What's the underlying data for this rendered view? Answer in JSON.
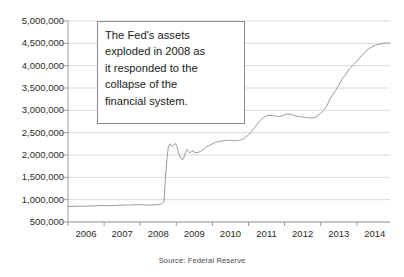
{
  "chart_data": {
    "type": "line",
    "title": "",
    "subtitle": "",
    "xlabel": "",
    "ylabel": "",
    "source_note": "Source: Federal Reserve",
    "grid": true,
    "legend": false,
    "legend_position": "none",
    "line_color": "#9a9a9a",
    "grid_color": "#d9d9d9",
    "axis_color": "#9a9a9a",
    "background_color": "#ffffff",
    "xlim": [
      2006.0,
      2014.92
    ],
    "ylim": [
      500000,
      5000000
    ],
    "y_tick_labels": [
      "5,000,000",
      "4,500,000",
      "4,000,000",
      "3,500,000",
      "3,000,000",
      "2,500,000",
      "2,000,000",
      "1,500,000",
      "1,000,000",
      "500,000"
    ],
    "y_tick_values": [
      5000000,
      4500000,
      4000000,
      3500000,
      3000000,
      2500000,
      2000000,
      1500000,
      1000000,
      500000
    ],
    "x_tick_labels": [
      "2006",
      "2007",
      "2008",
      "2009",
      "2010",
      "2011",
      "2012",
      "2013",
      "2014"
    ],
    "x_tick_values": [
      2006,
      2007,
      2008,
      2009,
      2010,
      2011,
      2012,
      2013,
      2014
    ],
    "annotations": [
      {
        "name": "fed-assets-callout",
        "text": "The Fed's assets exploded in 2008 as it responded to the collapse of the financial system.",
        "line1": "The Fed's assets",
        "line2": "exploded in 2008 as",
        "line3": "it responded to the",
        "line4": "collapse of the",
        "line5": "financial system."
      }
    ],
    "series": [
      {
        "name": "Federal Reserve Total Assets",
        "x": [
          2006.0,
          2006.08,
          2006.17,
          2006.25,
          2006.33,
          2006.42,
          2006.5,
          2006.58,
          2006.67,
          2006.75,
          2006.83,
          2006.92,
          2007.0,
          2007.08,
          2007.17,
          2007.25,
          2007.33,
          2007.42,
          2007.5,
          2007.58,
          2007.67,
          2007.75,
          2007.83,
          2007.92,
          2008.0,
          2008.08,
          2008.17,
          2008.25,
          2008.33,
          2008.42,
          2008.5,
          2008.58,
          2008.66,
          2008.7,
          2008.74,
          2008.78,
          2008.82,
          2008.86,
          2008.9,
          2008.94,
          2008.98,
          2009.02,
          2009.06,
          2009.1,
          2009.14,
          2009.18,
          2009.22,
          2009.26,
          2009.3,
          2009.34,
          2009.38,
          2009.42,
          2009.46,
          2009.5,
          2009.58,
          2009.67,
          2009.75,
          2009.83,
          2009.92,
          2010.0,
          2010.08,
          2010.17,
          2010.25,
          2010.33,
          2010.42,
          2010.5,
          2010.58,
          2010.67,
          2010.75,
          2010.83,
          2010.92,
          2011.0,
          2011.08,
          2011.17,
          2011.25,
          2011.33,
          2011.42,
          2011.5,
          2011.58,
          2011.67,
          2011.75,
          2011.83,
          2011.92,
          2012.0,
          2012.08,
          2012.17,
          2012.25,
          2012.33,
          2012.42,
          2012.5,
          2012.58,
          2012.67,
          2012.75,
          2012.83,
          2012.92,
          2013.0,
          2013.08,
          2013.17,
          2013.25,
          2013.33,
          2013.42,
          2013.5,
          2013.58,
          2013.67,
          2013.75,
          2013.83,
          2013.92,
          2014.0,
          2014.08,
          2014.17,
          2014.25,
          2014.33,
          2014.42,
          2014.5,
          2014.58,
          2014.67,
          2014.75,
          2014.83,
          2014.92
        ],
        "values": [
          850000,
          848000,
          850000,
          852000,
          855000,
          853000,
          856000,
          858000,
          860000,
          862000,
          864000,
          870000,
          868000,
          866000,
          868000,
          870000,
          872000,
          874000,
          876000,
          878000,
          880000,
          882000,
          885000,
          890000,
          890000,
          885000,
          880000,
          878000,
          880000,
          885000,
          890000,
          905000,
          960000,
          1500000,
          1900000,
          2180000,
          2250000,
          2200000,
          2210000,
          2240000,
          2255000,
          2180000,
          2050000,
          1960000,
          1910000,
          1900000,
          1960000,
          2080000,
          2120000,
          2070000,
          2050000,
          2080000,
          2100000,
          2060000,
          2050000,
          2080000,
          2120000,
          2180000,
          2220000,
          2250000,
          2280000,
          2300000,
          2310000,
          2320000,
          2330000,
          2330000,
          2320000,
          2320000,
          2330000,
          2350000,
          2400000,
          2450000,
          2520000,
          2620000,
          2700000,
          2780000,
          2840000,
          2880000,
          2890000,
          2880000,
          2870000,
          2860000,
          2870000,
          2900000,
          2920000,
          2910000,
          2890000,
          2870000,
          2860000,
          2850000,
          2840000,
          2830000,
          2830000,
          2840000,
          2880000,
          2930000,
          3000000,
          3100000,
          3240000,
          3350000,
          3450000,
          3570000,
          3680000,
          3780000,
          3880000,
          3960000,
          4030000,
          4100000,
          4180000,
          4250000,
          4320000,
          4380000,
          4420000,
          4450000,
          4470000,
          4490000,
          4500000,
          4510000,
          4500000
        ]
      }
    ]
  }
}
